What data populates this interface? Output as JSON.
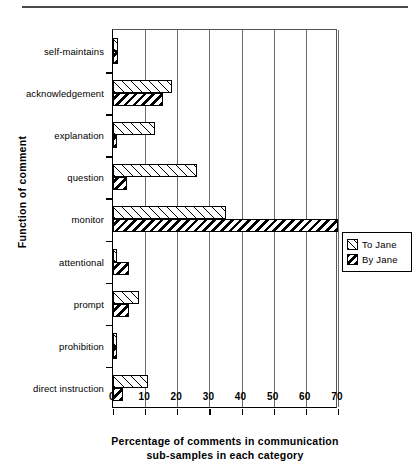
{
  "chart_data": {
    "type": "bar",
    "orientation": "horizontal",
    "title": "",
    "xlabel_line1": "Percentage of comments in communication",
    "xlabel_line2": "sub-samples in each category",
    "ylabel": "Function of comment",
    "categories": [
      "self-maintains",
      "acknowledgement",
      "explanation",
      "question",
      "monitor",
      "attentional",
      "prompt",
      "prohibition",
      "direct instruction"
    ],
    "series": [
      {
        "name": "To Jane",
        "values": [
          1.5,
          18.5,
          13.0,
          26.0,
          35.0,
          1.0,
          8.0,
          1.0,
          11.0
        ]
      },
      {
        "name": "By Jane",
        "values": [
          1.5,
          15.5,
          1.0,
          4.5,
          70.0,
          5.0,
          5.0,
          1.0,
          3.0
        ]
      }
    ],
    "xlim": [
      0,
      70
    ],
    "xticks": [
      0,
      10,
      20,
      30,
      40,
      50,
      60,
      70
    ],
    "xtick_labels": [
      "0",
      "10",
      "20",
      "30",
      "40",
      "50",
      "60",
      "70"
    ],
    "grid": "vertical",
    "legend_position": "right-middle",
    "legend_entries": [
      "To Jane",
      "By Jane"
    ]
  },
  "legend": {
    "to_jane": "To Jane",
    "by_jane": "By Jane"
  }
}
